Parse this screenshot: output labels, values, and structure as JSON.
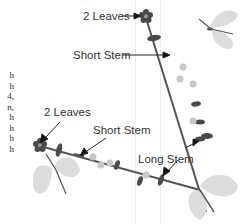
{
  "diagram": {
    "labels": {
      "top_two_leaves": "2 Leaves",
      "top_short_stem": "Short Stem",
      "lower_two_leaves": "2 Leaves",
      "lower_short_stem": "Short Stem",
      "long_stem": "Long Stem"
    },
    "clipped_body_text": [
      "h",
      "h",
      "4,",
      "n,",
      "h",
      "h",
      "h",
      "h"
    ],
    "colors": {
      "stem": "#555555",
      "leaf": "#4a4a4a",
      "flower_center": "#6a6a6a",
      "small_flower": "#c8c8c8",
      "butterfly_wing": "#dcdcdc",
      "text": "#333333"
    }
  }
}
